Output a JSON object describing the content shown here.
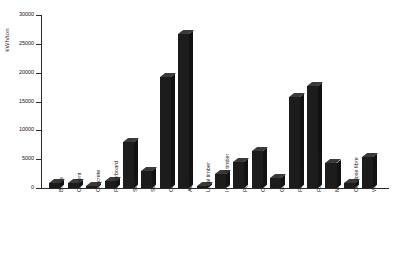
{
  "chart_data": {
    "type": "bar",
    "title": "",
    "subtitle": "",
    "xlabel": "",
    "ylabel": "kWh/ton",
    "ylim": [
      0,
      30000
    ],
    "ytick_labels": [
      "0",
      "5000",
      "10000",
      "15000",
      "20000",
      "25000",
      "30000"
    ],
    "ytick_values": [
      0,
      5000,
      10000,
      15000,
      20000,
      25000,
      30000
    ],
    "grid": false,
    "legend": null,
    "bar_color": "#1c1c1c",
    "axis_color": "#2b2b2b",
    "background": "#ffffff",
    "categories": [
      "Bricks",
      "Cement",
      "Concrete",
      "Plasterboard",
      "Steel",
      "Stainless",
      "Copper",
      "Aluminium",
      "Local timber",
      "Imported timber",
      "Plywood",
      "Chipboard",
      "Glass",
      "Plastics",
      "Foamed plastics",
      "Mineral wool",
      "Cellulose fibre",
      "Woodwool"
    ],
    "values": [
      800,
      900,
      400,
      1200,
      8000,
      3000,
      19300,
      26700,
      400,
      2400,
      4500,
      6400,
      1800,
      15800,
      17700,
      4400,
      900,
      5300
    ]
  }
}
